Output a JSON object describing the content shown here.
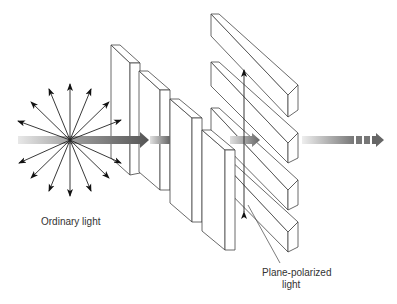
{
  "diagram": {
    "labels": {
      "ordinary_light": "Ordinary light",
      "plane_polarized_line1": "Plane-polarized",
      "plane_polarized_line2": "light"
    },
    "elements": {
      "source": "ordinary-light-source",
      "ray_count": 16,
      "vertical_plates": 4,
      "horizontal_slats": 4,
      "beam_arrows": [
        "incoming-beam",
        "middle-beam",
        "outgoing-beam"
      ]
    },
    "colors": {
      "line": "#444444",
      "beam_dark": "#555555",
      "beam_light": "#dddddd",
      "text": "#333333"
    }
  }
}
